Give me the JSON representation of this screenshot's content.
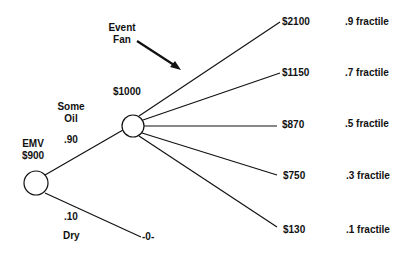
{
  "annotation": {
    "line1": "Event",
    "line2": "Fan"
  },
  "root": {
    "label": "EMV",
    "value": "$900"
  },
  "branches": {
    "oil": {
      "name_line1": "Some",
      "name_line2": "Oil",
      "probability": ".90",
      "value": "$1000"
    },
    "dry": {
      "probability": ".10",
      "name": "Dry",
      "outcome": "-0-"
    }
  },
  "fan": [
    {
      "value": "$2100",
      "fractile": ".9 fractile"
    },
    {
      "value": "$1150",
      "fractile": ".7 fractile"
    },
    {
      "value": "$870",
      "fractile": ".5 fractile"
    },
    {
      "value": "$750",
      "fractile": ".3 fractile"
    },
    {
      "value": "$130",
      "fractile": ".1 fractile"
    }
  ],
  "colors": {
    "ink": "#111111",
    "background": "#ffffff"
  }
}
